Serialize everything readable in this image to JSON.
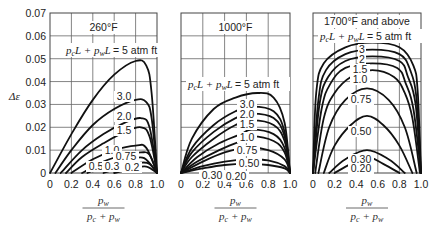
{
  "chart_data": [
    {
      "type": "line",
      "title": "260°F",
      "annotation": "p_cL + p_wL = 5 atm ft",
      "xlabel": "p_w / (p_c + p_w)",
      "ylabel": "Δε",
      "xlim": [
        0,
        1.0
      ],
      "ylim": [
        0,
        0.07
      ],
      "xticks": [
        "0",
        "0.2",
        "0.4",
        "0.6",
        "0.8",
        "1.0"
      ],
      "yticks": [
        "0",
        "0.01",
        "0.02",
        "0.03",
        "0.04",
        "0.05",
        "0.06",
        "0.07"
      ],
      "grid": true,
      "series": [
        {
          "name": "5",
          "label": "",
          "x": [
            0,
            0.2,
            0.4,
            0.6,
            0.8,
            0.9,
            0.95,
            1.0
          ],
          "y": [
            0,
            0.017,
            0.032,
            0.043,
            0.049,
            0.047,
            0.035,
            0
          ]
        },
        {
          "name": "3.0",
          "label": "3.0",
          "x": [
            0.05,
            0.2,
            0.4,
            0.6,
            0.8,
            0.9,
            0.95,
            1.0
          ],
          "y": [
            0,
            0.01,
            0.021,
            0.028,
            0.032,
            0.031,
            0.024,
            0
          ]
        },
        {
          "name": "2.0",
          "label": "2.0",
          "x": [
            0.1,
            0.3,
            0.5,
            0.7,
            0.85,
            0.93,
            1.0
          ],
          "y": [
            0,
            0.01,
            0.017,
            0.022,
            0.024,
            0.02,
            0
          ]
        },
        {
          "name": "1.5",
          "label": "1.5",
          "x": [
            0.15,
            0.3,
            0.5,
            0.7,
            0.85,
            0.93,
            1.0
          ],
          "y": [
            0,
            0.007,
            0.013,
            0.018,
            0.02,
            0.016,
            0
          ]
        },
        {
          "name": "1.0",
          "label": "1.0",
          "x": [
            0.2,
            0.4,
            0.6,
            0.8,
            0.9,
            1.0
          ],
          "y": [
            0,
            0.006,
            0.01,
            0.012,
            0.011,
            0
          ]
        },
        {
          "name": "0.75",
          "label": "0.75",
          "x": [
            0.3,
            0.5,
            0.7,
            0.85,
            0.93,
            1.0
          ],
          "y": [
            0,
            0.005,
            0.008,
            0.009,
            0.008,
            0
          ]
        },
        {
          "name": "0.5",
          "label": "0.5",
          "x": [
            0.35,
            0.55,
            0.75,
            0.88,
            1.0
          ],
          "y": [
            0,
            0.004,
            0.006,
            0.0065,
            0
          ]
        },
        {
          "name": "0.3",
          "label": "0.3",
          "x": [
            0.5,
            0.7,
            0.85,
            0.93,
            1.0
          ],
          "y": [
            0,
            0.003,
            0.0045,
            0.004,
            0
          ]
        },
        {
          "name": "0.2",
          "label": "0.2",
          "x": [
            0.6,
            0.78,
            0.9,
            1.0
          ],
          "y": [
            0,
            0.002,
            0.0028,
            0
          ]
        }
      ]
    },
    {
      "type": "line",
      "title": "1000°F",
      "annotation": "p_cL + p_wL = 5 atm ft",
      "xlabel": "p_w / (p_c + p_w)",
      "xlim": [
        0,
        1.0
      ],
      "ylim": [
        0,
        0.07
      ],
      "xticks": [
        "0",
        "0.2",
        "0.4",
        "0.6",
        "0.8",
        "1.0"
      ],
      "grid": true,
      "series": [
        {
          "name": "5",
          "label": "",
          "x": [
            0,
            0.1,
            0.3,
            0.5,
            0.7,
            0.85,
            0.95,
            1.0
          ],
          "y": [
            0,
            0.015,
            0.028,
            0.033,
            0.035,
            0.033,
            0.022,
            0
          ]
        },
        {
          "name": "3.0",
          "label": "3.0",
          "x": [
            0,
            0.1,
            0.3,
            0.5,
            0.65,
            0.85,
            0.95,
            1.0
          ],
          "y": [
            0,
            0.011,
            0.021,
            0.027,
            0.029,
            0.027,
            0.018,
            0
          ]
        },
        {
          "name": "2.0",
          "label": "2.0",
          "x": [
            0,
            0.1,
            0.3,
            0.5,
            0.65,
            0.85,
            0.95,
            1.0
          ],
          "y": [
            0,
            0.009,
            0.018,
            0.024,
            0.026,
            0.024,
            0.016,
            0
          ]
        },
        {
          "name": "1.5",
          "label": "1.5",
          "x": [
            0,
            0.1,
            0.3,
            0.5,
            0.65,
            0.85,
            0.95,
            1.0
          ],
          "y": [
            0,
            0.007,
            0.015,
            0.021,
            0.023,
            0.021,
            0.014,
            0
          ]
        },
        {
          "name": "1.0",
          "label": "1.0",
          "x": [
            0,
            0.15,
            0.35,
            0.55,
            0.65,
            0.85,
            0.95,
            1.0
          ],
          "y": [
            0,
            0.007,
            0.013,
            0.017,
            0.019,
            0.017,
            0.011,
            0
          ]
        },
        {
          "name": "0.75",
          "label": "0.75",
          "x": [
            0,
            0.15,
            0.35,
            0.55,
            0.65,
            0.85,
            0.95,
            1.0
          ],
          "y": [
            0,
            0.005,
            0.01,
            0.014,
            0.016,
            0.014,
            0.009,
            0
          ]
        },
        {
          "name": "0.50",
          "label": "0.50",
          "x": [
            0,
            0.2,
            0.4,
            0.6,
            0.8,
            0.95,
            1.0
          ],
          "y": [
            0,
            0.005,
            0.009,
            0.011,
            0.01,
            0.006,
            0
          ]
        },
        {
          "name": "0.30",
          "label": "0.30",
          "x": [
            0,
            0.2,
            0.4,
            0.6,
            0.8,
            0.95,
            1.0
          ],
          "y": [
            0,
            0.003,
            0.005,
            0.006,
            0.0055,
            0.003,
            0
          ]
        },
        {
          "name": "0.20",
          "label": "0.20",
          "x": [
            0,
            0.2,
            0.4,
            0.6,
            0.8,
            0.95,
            1.0
          ],
          "y": [
            0,
            0.002,
            0.0035,
            0.004,
            0.0035,
            0.002,
            0
          ]
        }
      ]
    },
    {
      "type": "line",
      "title": "1700°F and above",
      "annotation": "p_cL + p_wL = 5 atm ft",
      "xlabel": "p_w / (p_c + p_w)",
      "xlim": [
        0,
        1.0
      ],
      "ylim": [
        0,
        0.07
      ],
      "xticks": [
        "0",
        "0.2",
        "0.4",
        "0.6",
        "0.8",
        "1.0"
      ],
      "grid": true,
      "series": [
        {
          "name": "5",
          "label": "",
          "x": [
            0,
            0.03,
            0.1,
            0.3,
            0.55,
            0.8,
            0.93,
            0.97,
            1.0
          ],
          "y": [
            0,
            0.035,
            0.048,
            0.055,
            0.057,
            0.055,
            0.047,
            0.035,
            0
          ]
        },
        {
          "name": "3",
          "label": "3",
          "x": [
            0,
            0.05,
            0.12,
            0.3,
            0.55,
            0.8,
            0.9,
            0.96,
            1.0
          ],
          "y": [
            0,
            0.032,
            0.045,
            0.052,
            0.054,
            0.052,
            0.045,
            0.032,
            0
          ]
        },
        {
          "name": "2",
          "label": "2",
          "x": [
            0,
            0.06,
            0.14,
            0.3,
            0.55,
            0.8,
            0.88,
            0.95,
            1.0
          ],
          "y": [
            0,
            0.03,
            0.042,
            0.049,
            0.051,
            0.049,
            0.042,
            0.03,
            0
          ]
        },
        {
          "name": "1.5",
          "label": "1.5",
          "x": [
            0,
            0.08,
            0.16,
            0.3,
            0.55,
            0.78,
            0.86,
            0.93,
            1.0
          ],
          "y": [
            0,
            0.028,
            0.039,
            0.046,
            0.048,
            0.046,
            0.039,
            0.028,
            0
          ]
        },
        {
          "name": "1.0",
          "label": "1.0",
          "x": [
            0.02,
            0.1,
            0.2,
            0.35,
            0.55,
            0.75,
            0.85,
            0.92,
            0.99
          ],
          "y": [
            0,
            0.024,
            0.035,
            0.042,
            0.045,
            0.042,
            0.035,
            0.024,
            0
          ]
        },
        {
          "name": "0.75",
          "label": "0.75",
          "x": [
            0.05,
            0.15,
            0.3,
            0.5,
            0.7,
            0.85,
            0.96
          ],
          "y": [
            0,
            0.02,
            0.032,
            0.037,
            0.032,
            0.02,
            0
          ]
        },
        {
          "name": "0.50",
          "label": "0.50",
          "x": [
            0.1,
            0.2,
            0.35,
            0.5,
            0.65,
            0.8,
            0.92
          ],
          "y": [
            0,
            0.012,
            0.021,
            0.025,
            0.021,
            0.012,
            0
          ]
        },
        {
          "name": "0.30",
          "label": "0.30",
          "x": [
            0.15,
            0.3,
            0.5,
            0.7,
            0.85
          ],
          "y": [
            0,
            0.006,
            0.01,
            0.006,
            0
          ]
        },
        {
          "name": "0.20",
          "label": "0.20",
          "x": [
            0.2,
            0.35,
            0.5,
            0.65,
            0.8
          ],
          "y": [
            0,
            0.004,
            0.007,
            0.004,
            0
          ]
        }
      ]
    }
  ],
  "labels": {
    "ylabel": "Δε",
    "annotation_prefix": "p",
    "annotation_text": "= 5 atm ft",
    "xlabel_num": "p",
    "xlabel_num_sub": "w",
    "xlabel_den": "p",
    "panel_titles": [
      "260°F",
      "1000°F",
      "1700°F and above"
    ]
  }
}
